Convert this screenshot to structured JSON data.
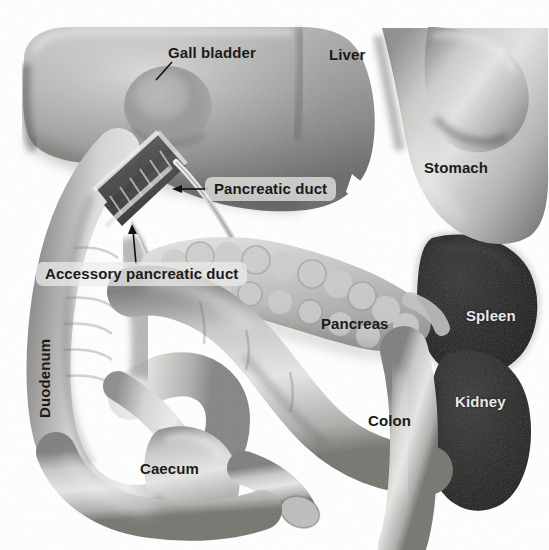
{
  "figure": {
    "kind": "anatomical-illustration",
    "style": "grayscale-airbrush-drawing",
    "width": 549,
    "height": 550,
    "background_color": "#ffffff"
  },
  "palette": {
    "page_background": "#ffffff",
    "organ_light": "#d9d9d7",
    "organ_mid": "#a8a8a6",
    "organ_shadow": "#5d5d5c",
    "organ_deep_shadow": "#3a3a39",
    "spleen_dark": "#1b1b1b",
    "kidney_dark": "#262625",
    "label_text": "#1b1b1b",
    "label_text_light": "#e8e8e8",
    "label_box": "rgba(236,236,234,0.72)",
    "leader_line": "#111111"
  },
  "labels": [
    {
      "id": "gall-bladder",
      "text": "Gall bladder",
      "x": 168,
      "y": 45,
      "style": "plain",
      "color": "#1b1b1b",
      "leader": "short-diagonal-down-left"
    },
    {
      "id": "liver",
      "text": "Liver",
      "x": 329,
      "y": 47,
      "style": "plain",
      "color": "#1b1b1b",
      "leader": "none"
    },
    {
      "id": "stomach",
      "text": "Stomach",
      "x": 424,
      "y": 160,
      "style": "plain",
      "color": "#1b1b1b",
      "leader": "none"
    },
    {
      "id": "pancreatic-duct",
      "text": "Pancreatic duct",
      "x": 213,
      "y": 181,
      "style": "boxed",
      "color": "#1b1b1b",
      "leader": "arrow-left"
    },
    {
      "id": "accessory-pancreatic-duct",
      "text": "Accessory pancreatic duct",
      "x": 42,
      "y": 266,
      "style": "boxed",
      "color": "#1b1b1b",
      "leader": "arrow-up"
    },
    {
      "id": "duodenum",
      "text": "Duodenum",
      "x": 44,
      "y": 403,
      "style": "vertical",
      "color": "#1b1b1b",
      "leader": "none"
    },
    {
      "id": "pancreas",
      "text": "Pancreas",
      "x": 321,
      "y": 316,
      "style": "plain",
      "color": "#1b1b1b",
      "leader": "none"
    },
    {
      "id": "spleen",
      "text": "Spleen",
      "x": 466,
      "y": 308,
      "style": "light",
      "color": "#e8e8e8",
      "leader": "none"
    },
    {
      "id": "kidney",
      "text": "Kidney",
      "x": 455,
      "y": 394,
      "style": "light",
      "color": "#e8e8e8",
      "leader": "none"
    },
    {
      "id": "colon",
      "text": "Colon",
      "x": 368,
      "y": 413,
      "style": "plain",
      "color": "#1b1b1b",
      "leader": "none"
    },
    {
      "id": "caecum",
      "text": "Caecum",
      "x": 140,
      "y": 461,
      "style": "plain",
      "color": "#1b1b1b",
      "leader": "none"
    }
  ],
  "organs": [
    {
      "id": "liver",
      "name": "Liver",
      "shade": "mid-gray",
      "region": "upper-left-and-center"
    },
    {
      "id": "gall-bladder",
      "name": "Gall bladder",
      "shade": "mid-gray",
      "region": "under-liver-left-of-center"
    },
    {
      "id": "stomach",
      "name": "Stomach",
      "shade": "light-gray",
      "region": "upper-right"
    },
    {
      "id": "duodenum",
      "name": "Duodenum",
      "shade": "light-gray",
      "region": "left-C-loop"
    },
    {
      "id": "pancreas",
      "name": "Pancreas",
      "shade": "light-gray-lobulated",
      "region": "center-right-transverse"
    },
    {
      "id": "pancreatic-duct",
      "name": "Pancreatic duct",
      "shade": "cutaway-dark",
      "region": "duodenum-cutaway"
    },
    {
      "id": "accessory-pancreatic-duct",
      "name": "Accessory pancreatic duct",
      "shade": "cutaway-dark",
      "region": "duodenum-cutaway"
    },
    {
      "id": "colon",
      "name": "Colon",
      "shade": "light-gray",
      "region": "lower-center-sweeping-right"
    },
    {
      "id": "caecum",
      "name": "Caecum",
      "shade": "light-gray",
      "region": "lower-left-center"
    },
    {
      "id": "spleen",
      "name": "Spleen",
      "shade": "near-black",
      "region": "right-upper"
    },
    {
      "id": "kidney",
      "name": "Kidney",
      "shade": "near-black",
      "region": "right-lower"
    }
  ]
}
